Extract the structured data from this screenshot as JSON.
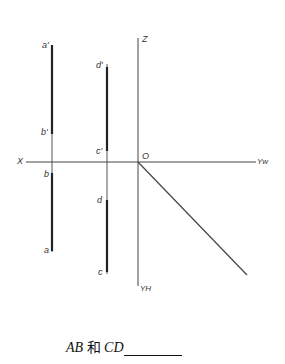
{
  "diagram": {
    "type": "orthographic-projection",
    "axes": {
      "x_label": "X",
      "z_label": "Z",
      "origin_label": "O",
      "yw_label": "Yw",
      "yh_label": "YH"
    },
    "points": {
      "a_prime": "a'",
      "b_prime": "b'",
      "c_prime": "c'",
      "d_prime": "d'",
      "a": "a",
      "b": "b",
      "c": "c",
      "d": "d"
    }
  },
  "caption": {
    "text_ab": "AB",
    "text_and": "和",
    "text_cd": "CD"
  }
}
